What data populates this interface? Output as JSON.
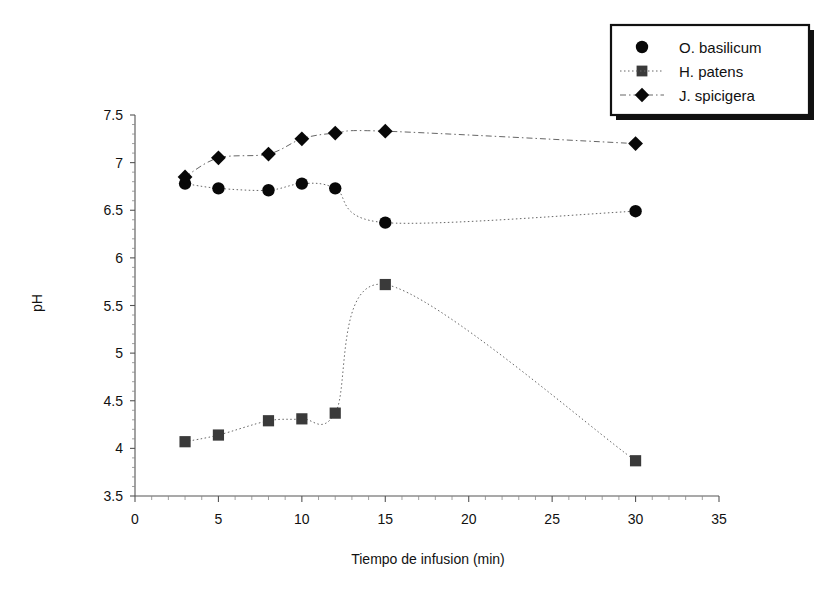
{
  "chart_data": {
    "type": "line",
    "title": "",
    "xlabel": "Tiempo de infusion (min)",
    "ylabel": "pH",
    "xlim": [
      0,
      35
    ],
    "ylim": [
      3.5,
      7.5
    ],
    "xticks": [
      0,
      5,
      10,
      15,
      20,
      25,
      30,
      35
    ],
    "yticks": [
      3.5,
      4,
      4.5,
      5,
      5.5,
      6,
      6.5,
      7,
      7.5
    ],
    "xtick_labels": [
      "0",
      "5",
      "10",
      "15",
      "20",
      "25",
      "30",
      "35"
    ],
    "ytick_labels": [
      "3.5",
      "4",
      "4.5",
      "5",
      "5.5",
      "6",
      "6.5",
      "7",
      "7.5"
    ],
    "grid": false,
    "legend_position": "top-right",
    "x": [
      3,
      5,
      8,
      10,
      12,
      15,
      30
    ],
    "series": [
      {
        "name": "O. basilicum",
        "marker": "circle",
        "line_style": "dotted",
        "values": [
          6.78,
          6.73,
          6.71,
          6.78,
          6.73,
          6.37,
          6.49
        ]
      },
      {
        "name": "H. patens",
        "marker": "square",
        "line_style": "dotted",
        "values": [
          4.07,
          4.14,
          4.29,
          4.31,
          4.37,
          5.72,
          3.87
        ]
      },
      {
        "name": "J. spicigera",
        "marker": "diamond",
        "line_style": "dash-dot",
        "values": [
          6.85,
          7.05,
          7.09,
          7.25,
          7.31,
          7.33,
          7.2
        ]
      }
    ]
  },
  "legend": {
    "items": [
      {
        "label": "O. basilicum",
        "marker": "circle"
      },
      {
        "label": "H. patens",
        "marker": "square"
      },
      {
        "label": "J. spicigera",
        "marker": "diamond"
      }
    ]
  },
  "axes": {
    "y_title": "pH",
    "x_title": "Tiempo de infusion (min)"
  }
}
